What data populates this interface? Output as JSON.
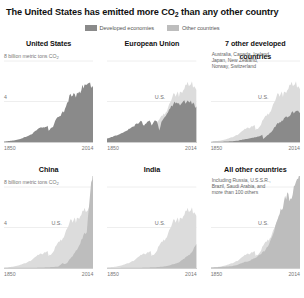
{
  "headline": {
    "before": "The United States has emitted more CO",
    "sub": "2",
    "after": " than any other country"
  },
  "legend": {
    "items": [
      {
        "label": "Developed economies",
        "color": "#8a8a8a"
      },
      {
        "label": "Other countries",
        "color": "#bdbdbd"
      }
    ]
  },
  "axis": {
    "y_top_label": "8 billion metric tons CO",
    "y_top_sub": "2",
    "y_mid_label": "4",
    "x_start": "1850",
    "x_end": "2014",
    "us_reference_label": "U.S."
  },
  "chart_data": {
    "type": "area",
    "title": "The United States has emitted more CO2 than any other country",
    "xlabel": "",
    "ylabel": "8 billion metric tons CO2",
    "xlim": [
      1850,
      2014
    ],
    "ylim": [
      0,
      8
    ],
    "grid": true,
    "legend_position": "top-center",
    "series_colors": {
      "developed": "#8a8a8a",
      "other": "#bdbdbd"
    },
    "panels": [
      {
        "title": "United States",
        "category": "developed",
        "show_y_labels": true,
        "members": "",
        "us_reference": false,
        "x": [
          1850,
          1860,
          1870,
          1880,
          1890,
          1900,
          1910,
          1918,
          1920,
          1930,
          1932,
          1940,
          1944,
          1950,
          1960,
          1970,
          1973,
          1975,
          1980,
          1982,
          1990,
          2000,
          2005,
          2008,
          2010,
          2014
        ],
        "values": [
          0.05,
          0.1,
          0.17,
          0.3,
          0.5,
          0.75,
          1.2,
          1.45,
          1.4,
          1.65,
          1.15,
          1.5,
          2.1,
          2.5,
          3.0,
          4.4,
          4.9,
          4.6,
          4.9,
          4.6,
          5.1,
          5.8,
          5.95,
          5.6,
          5.6,
          5.3
        ]
      },
      {
        "title": "European Union",
        "category": "developed",
        "show_y_labels": false,
        "members": "",
        "us_reference": true,
        "x": [
          1850,
          1860,
          1870,
          1880,
          1890,
          1900,
          1910,
          1913,
          1918,
          1920,
          1929,
          1932,
          1937,
          1940,
          1944,
          1946,
          1950,
          1960,
          1970,
          1979,
          1982,
          1990,
          2000,
          2008,
          2010,
          2014
        ],
        "values": [
          0.35,
          0.5,
          0.7,
          0.95,
          1.25,
          1.6,
          2.0,
          2.1,
          1.6,
          1.75,
          2.2,
          1.6,
          2.1,
          2.2,
          1.7,
          1.2,
          1.9,
          2.8,
          3.6,
          4.1,
          3.7,
          4.0,
          3.9,
          3.9,
          3.7,
          3.4
        ]
      },
      {
        "title": "7 other developed countries",
        "category": "developed",
        "show_y_labels": false,
        "members": "Australia, Canada, Iceland, Japan, New Zealand, Norway, Switzerland",
        "us_reference": true,
        "x": [
          1850,
          1870,
          1890,
          1900,
          1910,
          1920,
          1930,
          1940,
          1944,
          1946,
          1950,
          1960,
          1970,
          1980,
          1990,
          2000,
          2008,
          2010,
          2014
        ],
        "values": [
          0.01,
          0.03,
          0.08,
          0.14,
          0.25,
          0.35,
          0.45,
          0.6,
          0.7,
          0.3,
          0.5,
          0.95,
          1.7,
          2.1,
          2.5,
          2.9,
          3.05,
          2.95,
          3.0
        ]
      },
      {
        "title": "China",
        "category": "other",
        "show_y_labels": true,
        "members": "",
        "us_reference": true,
        "x": [
          1850,
          1900,
          1920,
          1940,
          1950,
          1958,
          1961,
          1965,
          1970,
          1975,
          1980,
          1985,
          1990,
          1995,
          2000,
          2002,
          2005,
          2008,
          2010,
          2012,
          2014
        ],
        "values": [
          0.01,
          0.02,
          0.05,
          0.1,
          0.15,
          0.5,
          0.35,
          0.45,
          0.8,
          1.1,
          1.5,
          1.85,
          2.4,
          3.2,
          3.4,
          3.7,
          5.7,
          7.2,
          8.3,
          9.2,
          9.7
        ]
      },
      {
        "title": "India",
        "category": "other",
        "show_y_labels": false,
        "members": "",
        "us_reference": true,
        "x": [
          1850,
          1900,
          1920,
          1940,
          1950,
          1960,
          1970,
          1980,
          1990,
          2000,
          2005,
          2010,
          2014
        ],
        "values": [
          0.005,
          0.02,
          0.04,
          0.08,
          0.12,
          0.2,
          0.35,
          0.5,
          0.85,
          1.25,
          1.5,
          2.0,
          2.4
        ]
      },
      {
        "title": "All other countries",
        "category": "other",
        "show_y_labels": false,
        "members": "Including Russia, U.S.S.R., Brazil, Saudi Arabia, and more than 100 others",
        "us_reference": true,
        "x": [
          1850,
          1870,
          1890,
          1900,
          1910,
          1920,
          1930,
          1940,
          1950,
          1960,
          1970,
          1980,
          1990,
          1992,
          1995,
          2000,
          2005,
          2008,
          2010,
          2012,
          2014
        ],
        "values": [
          0.05,
          0.1,
          0.2,
          0.35,
          0.55,
          0.7,
          0.95,
          1.3,
          1.8,
          2.8,
          4.3,
          5.9,
          7.4,
          7.1,
          6.9,
          7.3,
          8.2,
          8.9,
          9.2,
          9.7,
          10.0
        ]
      }
    ]
  }
}
